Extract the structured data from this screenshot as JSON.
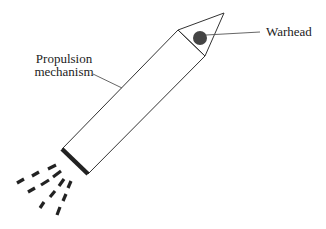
{
  "diagram": {
    "type": "labeled-illustration",
    "labels": {
      "warhead": "Warhead",
      "propulsion_line1": "Propulsion",
      "propulsion_line2": "mechanism"
    },
    "colors": {
      "outline": "#333333",
      "warhead_fill": "#444444",
      "nozzle": "#222222",
      "exhaust": "#222222",
      "background": "#ffffff"
    },
    "exhaust_rays": 4,
    "dashes_per_ray": 3
  }
}
